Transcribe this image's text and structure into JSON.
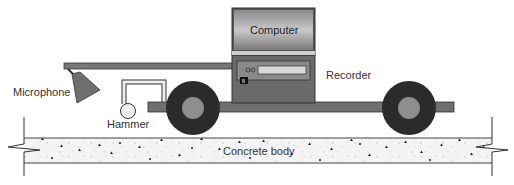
{
  "diagram": {
    "type": "schematic",
    "labels": {
      "computer": "Computer",
      "recorder": "Recorder",
      "microphone": "Microphone",
      "hammer": "Hammer",
      "concrete": "Concrete body"
    },
    "components": [
      {
        "id": "computer",
        "label": "Computer",
        "shape": "monitor box"
      },
      {
        "id": "recorder",
        "label": "Recorder",
        "shape": "box with display panel"
      },
      {
        "id": "microphone",
        "label": "Microphone",
        "shape": "cone on arm"
      },
      {
        "id": "hammer",
        "label": "Hammer",
        "shape": "circle on bracket"
      },
      {
        "id": "wheel-front",
        "shape": "wheel"
      },
      {
        "id": "wheel-rear",
        "shape": "wheel"
      },
      {
        "id": "chassis",
        "shape": "horizontal bar"
      },
      {
        "id": "concrete",
        "label": "Concrete body",
        "shape": "speckled slab with break lines"
      }
    ],
    "colors": {
      "dark": "#2a2a2a",
      "mid_gray": "#6f6f6f",
      "light_gray": "#a8a8a8",
      "panel": "#d9d9d9",
      "concrete": "#f2f2f2"
    }
  }
}
